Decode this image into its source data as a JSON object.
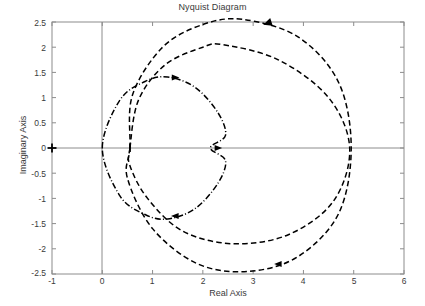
{
  "chart_data": {
    "type": "line",
    "title": "Nyquist Diagram",
    "xlabel": "Real Axis",
    "ylabel": "Imaginary Axis",
    "xlim": [
      -1,
      6
    ],
    "ylim": [
      -2.5,
      2.5
    ],
    "xticks": [
      "-1",
      "0",
      "1",
      "2",
      "3",
      "4",
      "5",
      "6"
    ],
    "xtick_values": [
      -1,
      0,
      1,
      2,
      3,
      4,
      5,
      6
    ],
    "yticks": [
      "-2.5",
      "-2",
      "-1.5",
      "-1",
      "-0.5",
      "0",
      "0.5",
      "1",
      "1.5",
      "2",
      "2.5"
    ],
    "ytick_values": [
      -2.5,
      -2,
      -1.5,
      -1,
      -0.5,
      0,
      0.5,
      1,
      1.5,
      2,
      2.5
    ],
    "grid": false,
    "legend": null,
    "axis_color": "#808080",
    "curve_color": "#000000",
    "series": [
      {
        "name": "cardioid-dashdot",
        "style": "dashdot",
        "color": "#000000",
        "description": "closed cardioid-like contour through origin with cusp on real axis",
        "key_points": [
          {
            "x": 0.0,
            "y": 0.0
          },
          {
            "x": 0.35,
            "y": 0.95
          },
          {
            "x": 0.85,
            "y": 1.32
          },
          {
            "x": 1.3,
            "y": 1.41
          },
          {
            "x": 1.85,
            "y": 1.2
          },
          {
            "x": 2.3,
            "y": 0.7
          },
          {
            "x": 2.45,
            "y": 0.25
          },
          {
            "x": 2.15,
            "y": 0.0
          },
          {
            "x": 2.45,
            "y": -0.25
          },
          {
            "x": 2.3,
            "y": -0.7
          },
          {
            "x": 1.85,
            "y": -1.2
          },
          {
            "x": 1.3,
            "y": -1.41
          },
          {
            "x": 0.85,
            "y": -1.32
          },
          {
            "x": 0.35,
            "y": -0.95
          },
          {
            "x": 0.0,
            "y": 0.0
          }
        ],
        "arrows": [
          {
            "x": 1.45,
            "y": 1.4,
            "dir": "right"
          },
          {
            "x": 1.45,
            "y": -1.35,
            "dir": "left"
          },
          {
            "x": 2.3,
            "y": 0.0,
            "dir": "right"
          }
        ]
      },
      {
        "name": "outer-dashed",
        "style": "dashed",
        "color": "#000000",
        "description": "large dashed loop, peaks near +2.55, crosses real axis near 4.95",
        "key_points": [
          {
            "x": 0.55,
            "y": 0.0
          },
          {
            "x": 0.6,
            "y": 1.05
          },
          {
            "x": 1.2,
            "y": 2.0
          },
          {
            "x": 2.0,
            "y": 2.45
          },
          {
            "x": 2.8,
            "y": 2.55
          },
          {
            "x": 3.9,
            "y": 2.2
          },
          {
            "x": 4.7,
            "y": 1.3
          },
          {
            "x": 4.95,
            "y": 0.0
          },
          {
            "x": 4.7,
            "y": -1.3
          },
          {
            "x": 3.9,
            "y": -2.15
          },
          {
            "x": 2.9,
            "y": -2.45
          },
          {
            "x": 1.9,
            "y": -2.3
          },
          {
            "x": 1.0,
            "y": -1.6
          },
          {
            "x": 0.5,
            "y": -0.6
          },
          {
            "x": 0.55,
            "y": 0.0
          }
        ],
        "arrows": [
          {
            "x": 3.3,
            "y": 2.48,
            "dir": "up-right"
          },
          {
            "x": 3.5,
            "y": -2.3,
            "dir": "left"
          }
        ]
      },
      {
        "name": "inner-dashed",
        "style": "dashed",
        "color": "#000000",
        "description": "inner dashed loop, peaks near +2.05, bottoms near -1.9",
        "key_points": [
          {
            "x": 0.55,
            "y": 0.0
          },
          {
            "x": 0.72,
            "y": 0.95
          },
          {
            "x": 1.25,
            "y": 1.65
          },
          {
            "x": 2.0,
            "y": 2.0
          },
          {
            "x": 2.4,
            "y": 2.05
          },
          {
            "x": 3.5,
            "y": 1.75
          },
          {
            "x": 4.5,
            "y": 1.0
          },
          {
            "x": 4.92,
            "y": 0.0
          },
          {
            "x": 4.6,
            "y": -1.05
          },
          {
            "x": 3.7,
            "y": -1.72
          },
          {
            "x": 2.6,
            "y": -1.9
          },
          {
            "x": 1.6,
            "y": -1.65
          },
          {
            "x": 0.9,
            "y": -1.0
          },
          {
            "x": 0.55,
            "y": -0.35
          },
          {
            "x": 0.55,
            "y": 0.0
          }
        ],
        "arrows": []
      }
    ],
    "markers": [
      {
        "name": "critical-point",
        "symbol": "+",
        "x": -1.0,
        "y": 0.0
      },
      {
        "name": "real-axis-tick",
        "symbol": "|",
        "x": 0.55,
        "y": 0.0
      }
    ]
  }
}
